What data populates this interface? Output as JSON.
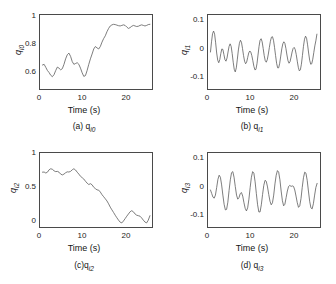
{
  "figure": {
    "background_color": "#ffffff",
    "line_color": "#5a5a5a",
    "axis_color": "#4a4a4a",
    "layout": "2x2 grid of subplots"
  },
  "chart_data": [
    {
      "type": "line",
      "panel": "a",
      "caption": "(a) q",
      "caption_sub": "i0",
      "ylabel": "q",
      "ylabel_sub": "i0",
      "xlabel": "Time (s)",
      "xticks": [
        "0",
        "10",
        "20"
      ],
      "xtick_values": [
        0,
        10,
        20
      ],
      "yticks": [
        "1",
        "0.8",
        "0.6"
      ],
      "ytick_values": [
        1,
        0.8,
        0.6
      ],
      "xlim": [
        -0.6,
        26.5
      ],
      "ylim": [
        0.52,
        1.06
      ],
      "grid": false,
      "legend": "none",
      "x": [
        0,
        0.4,
        0.8,
        1.2,
        1.6,
        2.0,
        2.4,
        2.8,
        3.2,
        3.6,
        4.0,
        4.4,
        4.8,
        5.2,
        5.6,
        6.0,
        6.4,
        6.8,
        7.2,
        7.6,
        8.0,
        8.4,
        8.8,
        9.2,
        9.6,
        10.0,
        10.4,
        10.8,
        11.2,
        11.6,
        12.0,
        12.4,
        12.8,
        13.2,
        13.6,
        14.0,
        14.4,
        14.8,
        15.2,
        15.6,
        16.0,
        16.4,
        16.8,
        17.2,
        17.6,
        18.0,
        18.4,
        18.8,
        19.2,
        19.6,
        20.0,
        20.4,
        20.8,
        21.2,
        21.6,
        22.0,
        22.4,
        22.8,
        23.2,
        23.6,
        24.0,
        24.4,
        24.8,
        25.2,
        25.6,
        26.0
      ],
      "y": [
        0.695,
        0.7,
        0.678,
        0.655,
        0.64,
        0.62,
        0.61,
        0.625,
        0.655,
        0.68,
        0.672,
        0.66,
        0.668,
        0.7,
        0.74,
        0.77,
        0.782,
        0.758,
        0.72,
        0.7,
        0.706,
        0.712,
        0.7,
        0.672,
        0.638,
        0.612,
        0.618,
        0.655,
        0.7,
        0.74,
        0.775,
        0.812,
        0.83,
        0.82,
        0.812,
        0.83,
        0.862,
        0.888,
        0.908,
        0.938,
        0.962,
        0.98,
        0.988,
        0.992,
        0.99,
        0.986,
        0.982,
        0.98,
        0.984,
        0.988,
        0.984,
        0.972,
        0.962,
        0.968,
        0.978,
        0.984,
        0.98,
        0.976,
        0.978,
        0.984,
        0.988,
        0.984,
        0.98,
        0.984,
        0.99,
        0.992
      ]
    },
    {
      "type": "line",
      "panel": "b",
      "caption": "(b) q",
      "caption_sub": "i1",
      "ylabel": "q",
      "ylabel_sub": "i1",
      "xlabel": "Time (s)",
      "xticks": [
        "0",
        "10",
        "20"
      ],
      "xtick_values": [
        0,
        10,
        20
      ],
      "yticks": [
        "0.1",
        "0",
        "-0.1"
      ],
      "ytick_values": [
        0.1,
        0,
        -0.1
      ],
      "xlim": [
        -0.6,
        26.5
      ],
      "ylim": [
        -0.145,
        0.145
      ],
      "grid": false,
      "legend": "none",
      "x": [
        0,
        0.25,
        0.5,
        0.75,
        1.0,
        1.25,
        1.5,
        1.75,
        2.0,
        2.25,
        2.5,
        2.75,
        3.0,
        3.25,
        3.5,
        3.75,
        4.0,
        4.25,
        4.5,
        4.75,
        5.0,
        5.25,
        5.5,
        5.75,
        6.0,
        6.25,
        6.5,
        6.75,
        7.0,
        7.25,
        7.5,
        7.75,
        8.0,
        8.25,
        8.5,
        8.75,
        9.0,
        9.25,
        9.5,
        9.75,
        10.0,
        10.25,
        10.5,
        10.75,
        11.0,
        11.25,
        11.5,
        11.75,
        12.0,
        12.25,
        12.5,
        12.75,
        13.0,
        13.25,
        13.5,
        13.75,
        14.0,
        14.25,
        14.5,
        14.75,
        15.0,
        15.25,
        15.5,
        15.75,
        16.0,
        16.25,
        16.5,
        16.75,
        17.0,
        17.25,
        17.5,
        17.75,
        18.0,
        18.25,
        18.5,
        18.75,
        19.0,
        19.25,
        19.5,
        19.75,
        20.0,
        20.25,
        20.5,
        20.75,
        21.0,
        21.25,
        21.5,
        21.75,
        22.0,
        22.25,
        22.5,
        22.75,
        23.0,
        23.25,
        23.5,
        23.75,
        24.0,
        24.25,
        24.5,
        24.75,
        25.0,
        25.25,
        25.5,
        25.75,
        26.0
      ],
      "y": [
        0.0,
        0.04,
        0.072,
        0.082,
        0.07,
        0.036,
        -0.004,
        -0.032,
        -0.042,
        -0.03,
        -0.006,
        0.012,
        0.01,
        -0.01,
        -0.03,
        -0.036,
        -0.024,
        0.0,
        0.022,
        0.032,
        0.022,
        -0.006,
        -0.04,
        -0.068,
        -0.078,
        -0.062,
        -0.028,
        0.008,
        0.034,
        0.046,
        0.038,
        0.014,
        -0.014,
        -0.036,
        -0.046,
        -0.04,
        -0.022,
        -0.004,
        0.004,
        0.0,
        -0.014,
        -0.034,
        -0.056,
        -0.07,
        -0.068,
        -0.046,
        -0.012,
        0.022,
        0.046,
        0.052,
        0.04,
        0.014,
        -0.014,
        -0.034,
        -0.04,
        -0.03,
        -0.008,
        0.018,
        0.042,
        0.058,
        0.06,
        0.046,
        0.018,
        -0.014,
        -0.044,
        -0.062,
        -0.062,
        -0.044,
        -0.016,
        0.012,
        0.032,
        0.04,
        0.034,
        0.014,
        -0.012,
        -0.034,
        -0.044,
        -0.038,
        -0.02,
        0.0,
        0.014,
        0.018,
        0.01,
        -0.01,
        -0.036,
        -0.06,
        -0.074,
        -0.07,
        -0.048,
        -0.014,
        0.022,
        0.05,
        0.062,
        0.054,
        0.028,
        -0.004,
        -0.032,
        -0.048,
        -0.046,
        -0.028,
        -0.002,
        0.024,
        0.044,
        0.07
      ]
    },
    {
      "type": "line",
      "panel": "c",
      "caption": "(c)q",
      "caption_sub": "i2",
      "ylabel": "q",
      "ylabel_sub": "i2",
      "xlabel": "Time (s)",
      "xticks": [
        "0",
        "10",
        "20"
      ],
      "xtick_values": [
        0,
        10,
        20
      ],
      "yticks": [
        "1",
        "0.5",
        "0"
      ],
      "ytick_values": [
        1,
        0.5,
        0
      ],
      "xlim": [
        -0.6,
        26.5
      ],
      "ylim": [
        -0.06,
        1.02
      ],
      "grid": false,
      "legend": "none",
      "x": [
        0,
        0.4,
        0.8,
        1.2,
        1.6,
        2.0,
        2.4,
        2.8,
        3.2,
        3.6,
        4.0,
        4.4,
        4.8,
        5.2,
        5.6,
        6.0,
        6.4,
        6.8,
        7.2,
        7.6,
        8.0,
        8.4,
        8.8,
        9.2,
        9.6,
        10.0,
        10.4,
        10.8,
        11.2,
        11.6,
        12.0,
        12.4,
        12.8,
        13.2,
        13.6,
        14.0,
        14.4,
        14.8,
        15.2,
        15.6,
        16.0,
        16.4,
        16.8,
        17.2,
        17.6,
        18.0,
        18.4,
        18.8,
        19.2,
        19.6,
        20.0,
        20.4,
        20.8,
        21.2,
        21.6,
        22.0,
        22.4,
        22.8,
        23.2,
        23.6,
        24.0,
        24.4,
        24.8,
        25.2,
        25.6,
        26.0
      ],
      "y": [
        0.74,
        0.742,
        0.728,
        0.74,
        0.775,
        0.79,
        0.782,
        0.76,
        0.748,
        0.752,
        0.74,
        0.712,
        0.7,
        0.712,
        0.732,
        0.745,
        0.742,
        0.752,
        0.775,
        0.79,
        0.772,
        0.74,
        0.712,
        0.68,
        0.66,
        0.64,
        0.608,
        0.58,
        0.56,
        0.572,
        0.556,
        0.52,
        0.5,
        0.482,
        0.478,
        0.45,
        0.412,
        0.382,
        0.352,
        0.32,
        0.278,
        0.23,
        0.19,
        0.152,
        0.112,
        0.075,
        0.04,
        0.01,
        0.0,
        0.028,
        0.062,
        0.098,
        0.13,
        0.162,
        0.178,
        0.162,
        0.13,
        0.112,
        0.105,
        0.098,
        0.072,
        0.04,
        0.012,
        0.0,
        0.04,
        0.105
      ]
    },
    {
      "type": "line",
      "panel": "d",
      "caption": "(d) q",
      "caption_sub": "i3",
      "ylabel": "q",
      "ylabel_sub": "i3",
      "xlabel": "Time (s)",
      "xticks": [
        "0",
        "10",
        "20"
      ],
      "xtick_values": [
        0,
        10,
        20
      ],
      "yticks": [
        "0.1",
        "0",
        "-0.1"
      ],
      "ytick_values": [
        0.1,
        0,
        -0.1
      ],
      "xlim": [
        -0.6,
        26.5
      ],
      "ylim": [
        -0.145,
        0.145
      ],
      "grid": false,
      "legend": "none",
      "x": [
        0,
        0.3,
        0.6,
        0.9,
        1.2,
        1.5,
        1.8,
        2.1,
        2.4,
        2.7,
        3.0,
        3.3,
        3.6,
        3.9,
        4.2,
        4.5,
        4.8,
        5.1,
        5.4,
        5.7,
        6.0,
        6.3,
        6.6,
        6.9,
        7.2,
        7.5,
        7.8,
        8.1,
        8.4,
        8.7,
        9.0,
        9.3,
        9.6,
        9.9,
        10.2,
        10.5,
        10.8,
        11.1,
        11.4,
        11.7,
        12.0,
        12.3,
        12.6,
        12.9,
        13.2,
        13.5,
        13.8,
        14.1,
        14.4,
        14.7,
        15.0,
        15.3,
        15.6,
        15.9,
        16.2,
        16.5,
        16.8,
        17.1,
        17.4,
        17.7,
        18.0,
        18.3,
        18.6,
        18.9,
        19.2,
        19.5,
        19.8,
        20.1,
        20.4,
        20.7,
        21.0,
        21.3,
        21.6,
        21.9,
        22.2,
        22.5,
        22.8,
        23.1,
        23.4,
        23.7,
        24.0,
        24.3,
        24.6,
        24.9,
        25.2,
        25.5,
        25.8,
        26.0
      ],
      "y": [
        0.0,
        -0.014,
        -0.028,
        -0.032,
        -0.02,
        0.01,
        0.042,
        0.058,
        0.05,
        0.02,
        -0.02,
        -0.056,
        -0.078,
        -0.076,
        -0.048,
        -0.002,
        0.04,
        0.068,
        0.072,
        0.05,
        0.014,
        -0.02,
        -0.036,
        -0.03,
        -0.014,
        -0.01,
        -0.024,
        -0.05,
        -0.072,
        -0.082,
        -0.07,
        -0.036,
        0.01,
        0.05,
        0.072,
        0.066,
        0.032,
        -0.014,
        -0.058,
        -0.086,
        -0.086,
        -0.058,
        -0.018,
        0.018,
        0.038,
        0.034,
        0.012,
        -0.018,
        -0.044,
        -0.058,
        -0.05,
        -0.02,
        0.024,
        0.058,
        0.076,
        0.07,
        0.04,
        -0.004,
        -0.042,
        -0.062,
        -0.056,
        -0.03,
        -0.004,
        0.014,
        0.018,
        0.014,
        0.016,
        0.014,
        0.0,
        -0.024,
        -0.05,
        -0.068,
        -0.062,
        -0.034,
        0.01,
        0.048,
        0.07,
        0.066,
        0.038,
        -0.004,
        -0.044,
        -0.07,
        -0.074,
        -0.054,
        -0.02,
        0.01,
        0.026
      ]
    }
  ]
}
